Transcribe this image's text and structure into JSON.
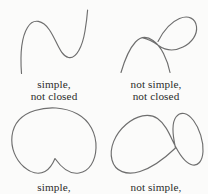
{
  "figure": {
    "background_color": "#fbfbfa",
    "stroke_color": "#6e6e6e",
    "text_color": "#2b2b2b"
  },
  "panels": [
    {
      "id": "top-left",
      "curve_name": "s-curve",
      "description": "open wavy S-shaped curve with no self-intersection",
      "caption_line1": "simple,",
      "caption_line2": "not closed",
      "path": "M 21.5 73.5 C 20.2 56.0 21.0 38.0 27.5 27.5 C 33.5 17.5 43.0 20.5 49.5 30.0 C 57.0 41.0 60.0 55.5 68.5 57.5 C 76.5 59.3 82.5 46.0 85.0 31.0 C 86.4 22.5 87.2 15.5 87.6 10.0"
    },
    {
      "id": "top-right",
      "curve_name": "looped-curve",
      "description": "open curve with one self-intersection forming a teardrop loop to the upper right",
      "caption_line1": "not simple,",
      "caption_line2": "not closed",
      "path": "M 121.0 72.5 C 124.5 60.5 129.5 48.5 135.5 42.0 C 141.5 35.5 147.5 36.5 153.0 40.5 C 157.0 43.4 160.5 47.5 163.5 53.5 C 167.0 60.5 169.0 67.0 170.0 72.5 M 158.0 41.5 C 163.0 31.5 171.0 22.0 179.5 18.5 C 188.5 14.8 195.5 18.5 196.5 26.5 C 197.5 34.5 192.0 42.5 183.0 47.0 C 174.5 51.3 165.5 50.5 158.5 45.5 C 153.5 41.9 148.5 39.0 143.0 38.0"
    },
    {
      "id": "bottom-left",
      "curve_name": "bean-curve",
      "description": "closed kidney or bean shaped curve with a notch indenting from the bottom, no self-intersection",
      "caption_line1": "simple,",
      "caption_line2": "",
      "path": "M 55.0 158.5 C 62.0 168.5 70.0 174.5 79.0 173.0 C 89.5 171.2 95.5 161.0 96.0 148.0 C 96.5 133.5 89.5 120.5 77.5 114.0 C 64.0 106.7 48.0 106.5 35.0 110.5 C 22.0 114.5 13.5 123.5 12.0 136.0 C 10.6 147.8 15.5 159.5 24.0 167.0 C 30.5 172.7 38.5 175.0 45.0 171.5 C 49.8 168.9 52.8 163.8 55.0 158.5"
    },
    {
      "id": "bottom-right",
      "curve_name": "figure-eight-curve",
      "description": "closed figure-eight or lemniscate with one self-intersection, large tilted left lobe and smaller steeply tilted right lobe",
      "caption_line1": "not simple,",
      "caption_line2": "",
      "path": "M 175.5 148.0 C 165.0 158.0 153.0 167.5 140.0 171.5 C 126.5 175.6 115.0 171.5 112.0 160.0 C 108.9 148.2 115.0 134.0 126.0 124.5 C 136.5 115.4 149.0 112.5 157.5 118.5 C 165.0 123.8 169.0 133.0 173.5 142.5 C 178.5 153.0 184.0 162.0 191.0 164.5 C 198.0 167.0 202.5 161.0 203.0 151.5 C 203.5 141.0 199.5 128.5 193.5 120.5 C 187.5 112.5 180.5 111.0 176.0 117.0 C 171.8 122.6 172.0 132.5 175.5 148.0"
    }
  ]
}
